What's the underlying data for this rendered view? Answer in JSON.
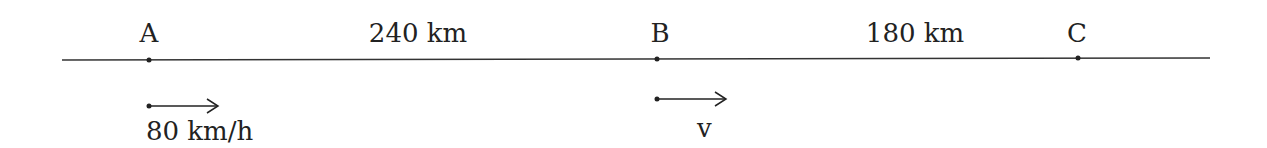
{
  "diagram": {
    "points": [
      {
        "label": "A"
      },
      {
        "label": "B"
      },
      {
        "label": "C"
      }
    ],
    "segments": [
      {
        "from": "A",
        "to": "B",
        "label": "240 km",
        "distance_km": 240
      },
      {
        "from": "B",
        "to": "C",
        "label": "180 km",
        "distance_km": 180
      }
    ],
    "velocities": [
      {
        "at": "A",
        "label": "80 km/h",
        "direction": "right"
      },
      {
        "at": "B",
        "label": "v",
        "direction": "right"
      }
    ],
    "line_color": "#333333"
  }
}
